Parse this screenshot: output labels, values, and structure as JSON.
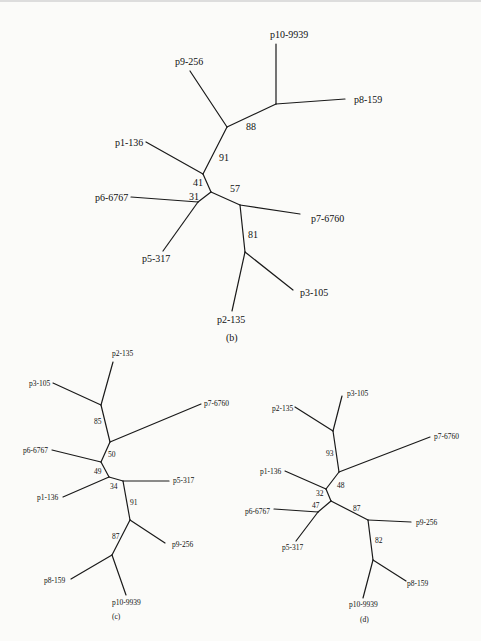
{
  "figure": {
    "panels": [
      {
        "id": "b",
        "caption": "(b)",
        "leaves": [
          "p10-9939",
          "p8-159",
          "p9-256",
          "p1-136",
          "p6-6767",
          "p5-317",
          "p7-6760",
          "p3-105",
          "p2-135"
        ],
        "bootstrap": [
          "88",
          "91",
          "41",
          "31",
          "57",
          "81"
        ]
      },
      {
        "id": "c",
        "caption": "(c)",
        "leaves": [
          "p2-135",
          "p3-105",
          "p7-6760",
          "p6-6767",
          "p5-317",
          "p1-136",
          "p9-256",
          "p8-159",
          "p10-9939"
        ],
        "bootstrap": [
          "85",
          "50",
          "49",
          "34",
          "91",
          "87"
        ]
      },
      {
        "id": "d",
        "caption": "(d)",
        "leaves": [
          "p3-105",
          "p2-135",
          "p7-6760",
          "p1-136",
          "p6-6767",
          "p5-317",
          "p9-256",
          "p8-159",
          "p10-9939"
        ],
        "bootstrap": [
          "93",
          "48",
          "32",
          "47",
          "87",
          "82"
        ]
      }
    ]
  }
}
